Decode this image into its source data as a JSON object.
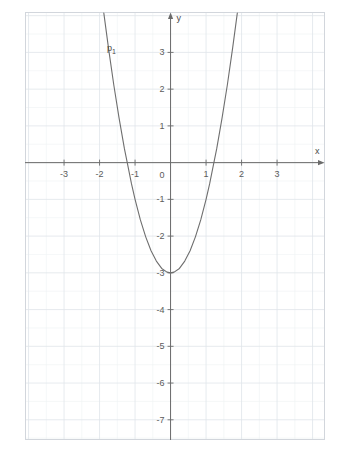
{
  "figure": {
    "background": "#ffffff",
    "plot_area": {
      "left": 25,
      "top": 12,
      "right": 325,
      "bottom": 440
    },
    "grid_color": "#dfe4ea",
    "minor_grid_color": "#eef1f4",
    "axis_color": "#6b6b6b",
    "curve_color": "#6e6e6e",
    "border_color": "#d2d6dc"
  },
  "axes": {
    "x_axis_label": "x",
    "y_axis_label": "y",
    "x_ticks": [
      "-3",
      "-2",
      "-1",
      "1",
      "2",
      "3"
    ],
    "y_ticks": [
      "3",
      "2",
      "1",
      "-1",
      "-2",
      "-3",
      "-4",
      "-5",
      "-6",
      "-7"
    ],
    "origin_label": "0"
  },
  "curve_label": {
    "base": "p",
    "sub": "1"
  },
  "chart_data": {
    "type": "line",
    "title": "",
    "subtitle": "",
    "xlabel": "x",
    "ylabel": "y",
    "grid": true,
    "legend": false,
    "xlim": [
      -4.1,
      4.35
    ],
    "ylim": [
      -7.55,
      4.1
    ],
    "xticks": [
      -3,
      -2,
      -1,
      1,
      2,
      3
    ],
    "yticks": [
      3,
      2,
      1,
      -1,
      -2,
      -3,
      -4,
      -5,
      -6,
      -7
    ],
    "minor_grid_step": 0.5,
    "series": [
      {
        "name": "p1",
        "label": "p₁",
        "equation": "y = 2x² - 3",
        "vertex": [
          0,
          -3
        ],
        "roots": [
          -1.22,
          1.22
        ],
        "color": "#6e6e6e",
        "x": [
          -1.88,
          -1.75,
          -1.6,
          -1.45,
          -1.3,
          -1.22,
          -1.1,
          -1.0,
          -0.85,
          -0.7,
          -0.55,
          -0.4,
          -0.25,
          -0.1,
          0,
          0.1,
          0.25,
          0.4,
          0.55,
          0.7,
          0.85,
          1.0,
          1.1,
          1.22,
          1.3,
          1.45,
          1.6,
          1.75,
          1.88
        ],
        "y": [
          4.07,
          3.13,
          2.12,
          1.21,
          0.38,
          0.0,
          -0.58,
          -1.0,
          -1.56,
          -2.02,
          -2.4,
          -2.68,
          -2.88,
          -2.98,
          -3.0,
          -2.98,
          -2.88,
          -2.68,
          -2.4,
          -2.02,
          -1.56,
          -1.0,
          -0.58,
          0.0,
          0.38,
          1.21,
          2.12,
          3.13,
          4.07
        ]
      }
    ]
  }
}
